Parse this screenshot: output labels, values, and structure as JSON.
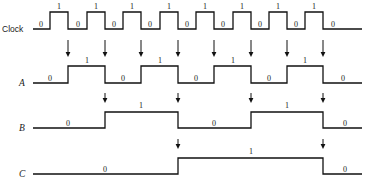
{
  "diagram": {
    "type": "digital-timing-diagram",
    "width": 367,
    "height": 191,
    "background_color": "#ffffff",
    "line_color": "#111111",
    "label_color": "#1a1a1a",
    "level_high_label": "1",
    "level_low_label": "0",
    "time_axis": {
      "start_x": 33,
      "end_x": 362,
      "clock_period_px": 36.6,
      "cycles": 9
    },
    "rows": [
      {
        "id": "clock",
        "label": "Clock",
        "label_style": "sans",
        "baseline_y": 29,
        "high_y": 12,
        "start_x": 33,
        "end_x": 362,
        "initial_level": 0,
        "transitions_x": [
          50,
          68,
          87,
          105,
          123,
          141,
          160,
          178,
          196,
          214,
          233,
          251,
          269,
          287,
          305,
          323
        ],
        "level_labels": [
          {
            "text": "0",
            "x": 41,
            "y": 27
          },
          {
            "text": "1",
            "x": 59,
            "y": 9
          },
          {
            "text": "0",
            "x": 78,
            "y": 27
          },
          {
            "text": "1",
            "x": 96,
            "y": 9
          },
          {
            "text": "0",
            "x": 114,
            "y": 27
          },
          {
            "text": "1",
            "x": 132,
            "y": 9
          },
          {
            "text": "0",
            "x": 150,
            "y": 27
          },
          {
            "text": "1",
            "x": 169,
            "y": 9
          },
          {
            "text": "0",
            "x": 187,
            "y": 27
          },
          {
            "text": "1",
            "x": 205,
            "y": 9
          },
          {
            "text": "0",
            "x": 223,
            "y": 27
          },
          {
            "text": "1",
            "x": 242,
            "y": 9
          },
          {
            "text": "0",
            "x": 260,
            "y": 27
          },
          {
            "text": "1",
            "x": 278,
            "y": 9
          },
          {
            "text": "0",
            "x": 296,
            "y": 27
          },
          {
            "text": "1",
            "x": 314,
            "y": 9
          },
          {
            "text": "0",
            "x": 333,
            "y": 27
          }
        ]
      },
      {
        "id": "a",
        "label": "A",
        "label_style": "italic-serif",
        "baseline_y": 83,
        "high_y": 66,
        "start_x": 33,
        "end_x": 362,
        "initial_level": 0,
        "transitions_x": [
          68,
          105,
          141,
          178,
          214,
          251,
          287,
          323
        ],
        "level_labels": [
          {
            "text": "0",
            "x": 50,
            "y": 81
          },
          {
            "text": "1",
            "x": 87,
            "y": 63
          },
          {
            "text": "0",
            "x": 123,
            "y": 81
          },
          {
            "text": "1",
            "x": 160,
            "y": 63
          },
          {
            "text": "0",
            "x": 196,
            "y": 81
          },
          {
            "text": "1",
            "x": 233,
            "y": 63
          },
          {
            "text": "0",
            "x": 269,
            "y": 81
          },
          {
            "text": "1",
            "x": 305,
            "y": 63
          },
          {
            "text": "0",
            "x": 343,
            "y": 81
          }
        ]
      },
      {
        "id": "b",
        "label": "B",
        "label_style": "italic-serif",
        "baseline_y": 128,
        "high_y": 112,
        "start_x": 33,
        "end_x": 362,
        "initial_level": 0,
        "transitions_x": [
          105,
          178,
          251,
          323
        ],
        "level_labels": [
          {
            "text": "0",
            "x": 68,
            "y": 126
          },
          {
            "text": "1",
            "x": 141,
            "y": 108
          },
          {
            "text": "0",
            "x": 214,
            "y": 126
          },
          {
            "text": "1",
            "x": 287,
            "y": 108
          },
          {
            "text": "0",
            "x": 345,
            "y": 126
          }
        ]
      },
      {
        "id": "c",
        "label": "C",
        "label_style": "italic-serif",
        "baseline_y": 174,
        "high_y": 158,
        "start_x": 33,
        "end_x": 362,
        "initial_level": 0,
        "transitions_x": [
          178,
          323
        ],
        "level_labels": [
          {
            "text": "0",
            "x": 105,
            "y": 172
          },
          {
            "text": "1",
            "x": 251,
            "y": 154
          },
          {
            "text": "0",
            "x": 345,
            "y": 172
          }
        ]
      }
    ],
    "arrow_groups": [
      {
        "id": "arrows-clock-to-a",
        "target_row": "a",
        "tip_y": 57,
        "tail_y": 40,
        "x_positions": [
          68,
          105,
          141,
          178,
          214,
          251,
          287,
          323
        ]
      },
      {
        "id": "arrows-a-to-b",
        "target_row": "b",
        "tip_y": 103,
        "tail_y": 93,
        "x_positions": [
          105,
          178,
          251,
          323
        ]
      },
      {
        "id": "arrows-b-to-c",
        "target_row": "c",
        "tip_y": 149,
        "tail_y": 139,
        "x_positions": [
          178,
          323
        ]
      }
    ],
    "row_label_positions": [
      {
        "row": "clock",
        "x": 2,
        "y": 32
      },
      {
        "row": "a",
        "x": 19,
        "y": 86
      },
      {
        "row": "b",
        "x": 19,
        "y": 131
      },
      {
        "row": "c",
        "x": 19,
        "y": 177
      }
    ]
  }
}
